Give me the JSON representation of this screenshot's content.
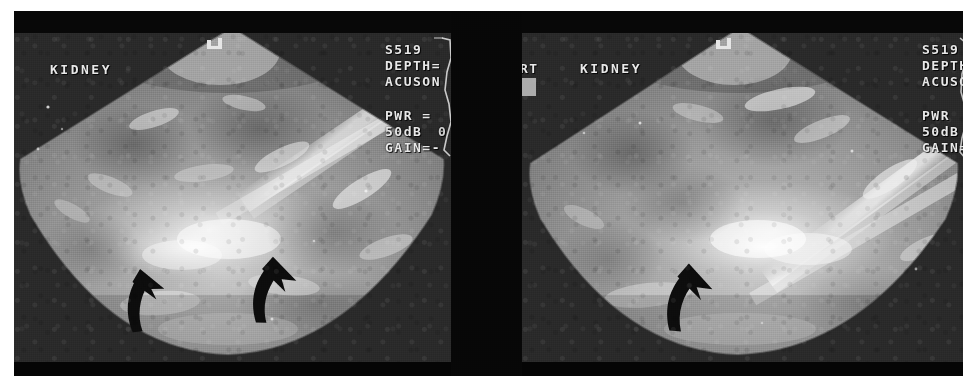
{
  "figure": {
    "modality": "ultrasound",
    "background_color": "#ffffff",
    "panel_background": "#0a0a0a",
    "tissue_color": "#8e8e8e",
    "annotation_color": "#0d0d0d",
    "osd_text_color": "#e8e8e8"
  },
  "panels": [
    {
      "id": "left",
      "position_label": "",
      "organ_label": "KIDNEY",
      "osd": {
        "probe_id": "S519",
        "depth_line": "DEPTH=",
        "vendor": "ACUSON",
        "power_line": "PWR =",
        "db_line": "50dB",
        "db_extra": "0",
        "gain_line": "GAIN=-"
      },
      "arrows": [
        {
          "name": "arrow-lower-left",
          "x": 108,
          "y": 236,
          "rotation": -6,
          "scale": 1.0
        },
        {
          "name": "arrow-lower-right",
          "x": 238,
          "y": 222,
          "rotation": 2,
          "scale": 1.05
        }
      ],
      "finding": "hyperechoic region marked by two curved arrows"
    },
    {
      "id": "right",
      "position_label": "RT",
      "organ_label": "KIDNEY",
      "osd": {
        "probe_id": "S519",
        "depth_line": "DEPTH",
        "vendor": "ACUSO",
        "power_line": "PWR",
        "db_line": "50dB",
        "db_extra": "",
        "gain_line": "GAIN="
      },
      "arrows": [
        {
          "name": "arrow-center",
          "x": 146,
          "y": 228,
          "rotation": 4,
          "scale": 1.05
        }
      ],
      "finding": "hyperechoic region marked by one curved arrow"
    }
  ]
}
